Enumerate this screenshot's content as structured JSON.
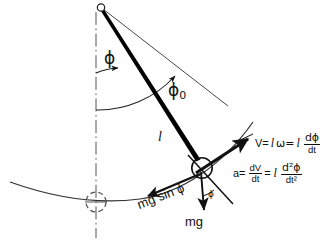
{
  "figure": {
    "background_color": "#ffffff",
    "ink_color": "#111111",
    "rod_color": "#000000"
  },
  "labels": {
    "angle_phi": "ϕ",
    "angle_phi0": "ϕ",
    "angle_phi0_sub": "0",
    "angle_phi_bob": "ϕ",
    "length": "l",
    "weight": "mg",
    "tangential_force": "mg sin ϕ"
  },
  "equations": {
    "velocity": {
      "lhs": "V=",
      "l1": "l",
      "omega": "ω=",
      "l2": "l",
      "num": "dϕ",
      "den": "dt"
    },
    "acceleration": {
      "lhs": "a=",
      "num1": "dV",
      "den1": "dt",
      "mid": "=",
      "l": "l",
      "num2": "d²ϕ",
      "den2": "dt²"
    }
  },
  "geometry": {
    "pivot": {
      "x": 101,
      "y": 8,
      "r": 3.6
    },
    "bob": {
      "x": 202,
      "y": 168,
      "r": 10.2
    },
    "equilibrium": {
      "x": 96,
      "y": 202,
      "r": 10
    },
    "rod": {
      "x1": 101,
      "y1": 9,
      "x2": 199,
      "y2": 163
    },
    "amplitude_line": {
      "x1": 103,
      "y1": 9,
      "x2": 228,
      "y2": 106
    },
    "vertical_axis": {
      "x": 96,
      "y1": 12,
      "y2": 238
    },
    "arc": {
      "start_x": 10,
      "start_y": 182,
      "end_x": 253,
      "end_y": 122
    }
  },
  "icons": {
    "pivot": "pivot-circle-icon",
    "bob": "bob-circle-icon",
    "equilibrium": "dashed-circle-icon"
  }
}
